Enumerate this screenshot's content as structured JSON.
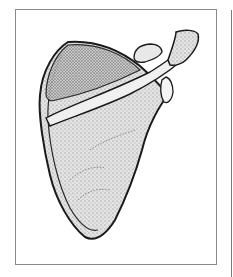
{
  "figure": {
    "colors": {
      "outline": "#1a1a1a",
      "fill": "#d9d9d9",
      "frame": "#8a8a8a"
    }
  }
}
